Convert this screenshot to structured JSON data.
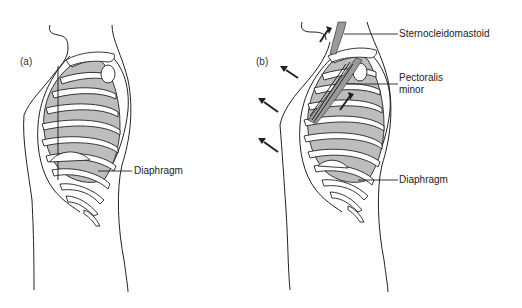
{
  "figure": {
    "panels": [
      {
        "id": "a",
        "label": "(a)",
        "annotations": [
          "Diaphragm"
        ]
      },
      {
        "id": "b",
        "label": "(b)",
        "annotations": [
          "Sternocleidomastoid",
          "Pectoralis minor",
          "Diaphragm"
        ]
      }
    ]
  },
  "labels": {
    "panel_a": "(a)",
    "panel_b": "(b)",
    "a_diaphragm": "Diaphragm",
    "b_sternocleidomastoid": "Sternocleidomastoid",
    "b_pectoralis_line1": "Pectoralis",
    "b_pectoralis_line2": "minor",
    "b_diaphragm": "Diaphragm"
  },
  "colors": {
    "lung_fill": "#bdbdbd",
    "muscle_fill": "#9a9a9a",
    "line": "#222222",
    "background": "#ffffff"
  }
}
